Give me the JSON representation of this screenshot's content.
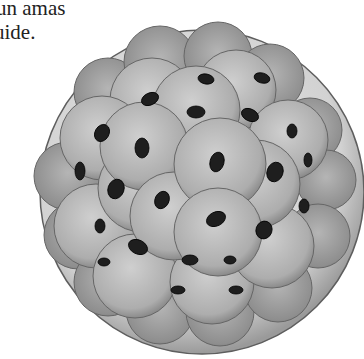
{
  "caption": {
    "line1": "un amas",
    "line2": "uide."
  },
  "illustration": {
    "subject": "morula-cell-cluster",
    "colors": {
      "membrane": "#d9d9d9",
      "membrane_edge": "#6a6a6a",
      "cell": "#a8a8a8",
      "cell_light": "#c4c4c4",
      "nucleus": "#1e1e1e"
    }
  }
}
